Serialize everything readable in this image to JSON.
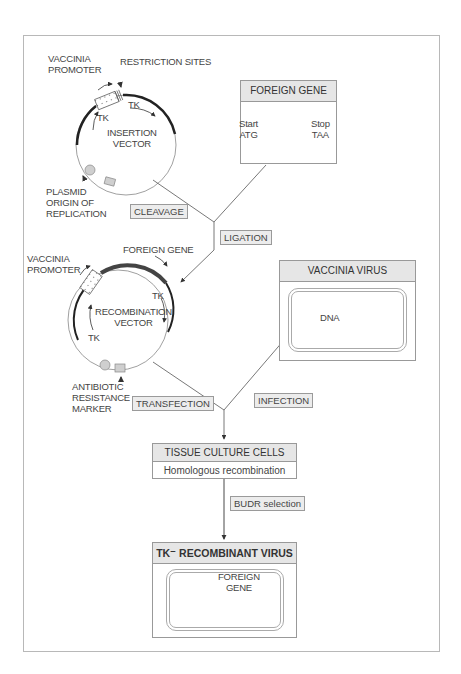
{
  "insertion_vector": {
    "vaccinia_promoter": [
      "VACCINIA",
      "PROMOTER"
    ],
    "restriction_sites": "RESTRICTION SITES",
    "tk_right": "TK",
    "tk_left": "TK",
    "title": [
      "INSERTION",
      "VECTOR"
    ],
    "plasmid_origin": [
      "PLASMID",
      "ORIGIN OF",
      "REPLICATION"
    ]
  },
  "foreign_gene_box": {
    "title": "FOREIGN GENE",
    "start_label": [
      "Start",
      "ATG"
    ],
    "stop_label": [
      "Stop",
      "TAA"
    ]
  },
  "steps": {
    "cleavage": "CLEAVAGE",
    "ligation": "LIGATION",
    "transfection": "TRANSFECTION",
    "infection": "INFECTION",
    "budr_selection": "BUDR selection"
  },
  "recombination_vector": {
    "vaccinia_promoter": [
      "VACCINIA",
      "PROMOTER"
    ],
    "foreign_gene": "FOREIGN GENE",
    "tk_right": "TK",
    "tk_left": "TK",
    "title": [
      "RECOMBINATION",
      "VECTOR"
    ],
    "antibiotic_marker": [
      "ANTIBIOTIC",
      "RESISTANCE",
      "MARKER"
    ]
  },
  "vaccinia_virus_box": {
    "title": "VACCINIA VIRUS",
    "dna_label": "DNA"
  },
  "tissue_culture_box": {
    "title": "TISSUE CULTURE CELLS",
    "subtitle": "Homologous recombination"
  },
  "recombinant_box": {
    "title": "TK⁻ RECOMBINANT VIRUS",
    "foreign_gene_label": [
      "FOREIGN",
      "GENE"
    ]
  },
  "colors": {
    "dark_line": "#222222",
    "gene_bar": "#555555",
    "dna_gray": "#9a9a9a",
    "header_fill": "#e6e6e6"
  }
}
